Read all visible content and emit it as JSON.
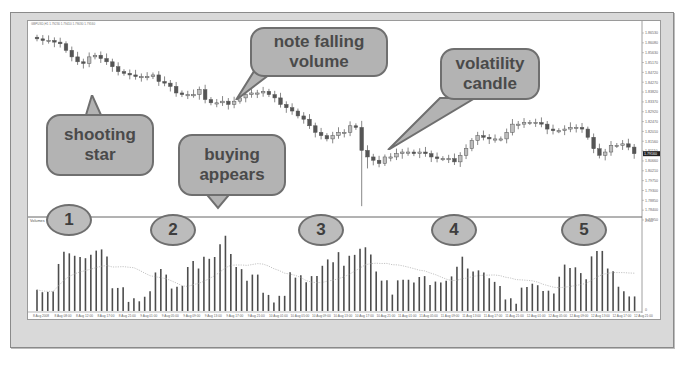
{
  "chart_data": [
    {
      "type": "candlestick",
      "title": "GBPUSD,H1",
      "pane": "price",
      "ylim": [
        1.752,
        1.866
      ],
      "y_tick_labels": [
        "1.86530",
        "1.86080",
        "1.85630",
        "1.85170",
        "1.84720",
        "1.84270",
        "1.83820",
        "1.83370",
        "1.82920",
        "1.82470",
        "1.82010",
        "1.81560",
        "1.81110",
        "1.80660",
        "1.80210",
        "1.79750",
        "1.79300",
        "1.78850",
        "1.78400",
        "1.77950"
      ],
      "trend_description": "Downtrend from top-left, sharp volatility candle with long lower wick near middle, then sideways-to-higher recovery, then dip at the right edge",
      "closes": [
        1.86,
        1.859,
        1.859,
        1.858,
        1.857,
        1.853,
        1.849,
        1.846,
        1.845,
        1.849,
        1.85,
        1.848,
        1.846,
        1.843,
        1.84,
        1.839,
        1.838,
        1.837,
        1.837,
        1.837,
        1.838,
        1.834,
        1.833,
        1.831,
        1.827,
        1.826,
        1.826,
        1.826,
        1.829,
        1.823,
        1.821,
        1.821,
        1.822,
        1.82,
        1.822,
        1.824,
        1.826,
        1.827,
        1.827,
        1.828,
        1.826,
        1.824,
        1.82,
        1.818,
        1.816,
        1.813,
        1.811,
        1.807,
        1.803,
        1.801,
        1.799,
        1.801,
        1.803,
        1.803,
        1.807,
        1.806,
        1.792,
        1.788,
        1.786,
        1.784,
        1.788,
        1.788,
        1.79,
        1.791,
        1.791,
        1.79,
        1.791,
        1.79,
        1.788,
        1.787,
        1.787,
        1.787,
        1.785,
        1.789,
        1.793,
        1.798,
        1.801,
        1.8,
        1.799,
        1.799,
        1.799,
        1.803,
        1.808,
        1.808,
        1.809,
        1.809,
        1.809,
        1.808,
        1.805,
        1.804,
        1.804,
        1.805,
        1.806,
        1.806,
        1.805,
        1.8,
        1.793,
        1.789,
        1.791,
        1.795,
        1.795,
        1.796,
        1.794,
        1.79
      ],
      "annotations": [
        "shooting star",
        "note falling volume",
        "volatility candle",
        "buying appears"
      ]
    },
    {
      "type": "bar",
      "title": "Volumes",
      "pane": "volume",
      "ylim": [
        0,
        2900
      ],
      "y_tick_labels": [
        "2900",
        "0"
      ],
      "values": [
        700,
        620,
        630,
        640,
        1550,
        1950,
        1900,
        1820,
        1780,
        1740,
        1850,
        1990,
        2030,
        1800,
        750,
        760,
        780,
        300,
        420,
        320,
        470,
        650,
        1270,
        1380,
        1200,
        740,
        800,
        830,
        1450,
        1650,
        1400,
        1790,
        1720,
        1780,
        2200,
        2480,
        1880,
        1450,
        1380,
        1000,
        1200,
        1200,
        600,
        530,
        280,
        500,
        500,
        1280,
        1100,
        1180,
        950,
        1150,
        1150,
        1490,
        1700,
        1610,
        1940,
        1490,
        1820,
        1850,
        2050,
        2100,
        1860,
        1300,
        1000,
        1010,
        540,
        1010,
        1030,
        1030,
        940,
        1120,
        1150,
        860,
        970,
        940,
        1000,
        1140,
        1460,
        1790,
        1400,
        1300,
        1340,
        1270,
        1080,
        960,
        820,
        380,
        420,
        240,
        770,
        790,
        900,
        850,
        660,
        670,
        580,
        1130,
        1530,
        1420,
        1440,
        1250,
        1050,
        1800,
        1980,
        1980,
        1400,
        1310,
        800,
        650,
        480,
        480
      ],
      "moving_average_dotted": true,
      "numbered_markers": [
        "1",
        "2",
        "3",
        "4",
        "5"
      ]
    }
  ],
  "window": {
    "header_text": "GBPUSD,H1  1.79230 1.79410 1.79030 1.79160"
  },
  "x_axis": {
    "labels": [
      "8 Aug 2008",
      "8 Aug 08:00",
      "8 Aug 12:00",
      "8 Aug 17:00",
      "8 Aug 21:00",
      "9 Aug 01:00",
      "9 Aug 05:00",
      "9 Aug 09:00",
      "9 Aug 13:00",
      "9 Aug 17:00",
      "9 Aug 21:00",
      "10 Aug 01:00",
      "10 Aug 05:00",
      "10 Aug 09:00",
      "10 Aug 13:00",
      "10 Aug 17:00",
      "10 Aug 21:00",
      "11 Aug 01:00",
      "11 Aug 05:00",
      "11 Aug 09:00",
      "11 Aug 13:00",
      "11 Aug 17:00",
      "11 Aug 21:00",
      "12 Aug 01:00",
      "12 Aug 05:00",
      "12 Aug 09:00",
      "12 Aug 13:00",
      "12 Aug 17:00",
      "12 Aug 21:00"
    ]
  },
  "callouts": {
    "shooting_star": "shooting\nstar",
    "shooting_star_l1": "shooting",
    "shooting_star_l2": "star",
    "falling_volume_l1": "note falling",
    "falling_volume_l2": "volume",
    "volatility_l1": "volatility",
    "volatility_l2": "candle",
    "buying_l1": "buying",
    "buying_l2": "appears"
  },
  "markers": [
    "1",
    "2",
    "3",
    "4",
    "5"
  ],
  "price_axis": {
    "current_price_label": "1.79160"
  },
  "volume_pane": {
    "title": "Volumes",
    "top_label": "2900",
    "bottom_label": "0"
  },
  "colors": {
    "frame": "#d9d9d9",
    "bubble_fill": "#b3b3b3",
    "bubble_border": "#6f6f6f",
    "bubble_text": "#4a4a4a",
    "candle": "#555555",
    "volume_bar": "#4d4d4d"
  }
}
